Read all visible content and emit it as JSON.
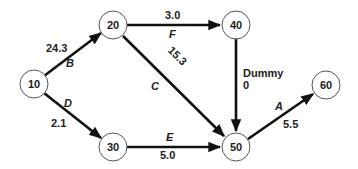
{
  "diagram": {
    "type": "activity-on-arrow network",
    "nodes": [
      {
        "id": "10",
        "label": "10",
        "x": 34,
        "y": 84
      },
      {
        "id": "20",
        "label": "20",
        "x": 113,
        "y": 25
      },
      {
        "id": "30",
        "label": "30",
        "x": 113,
        "y": 147
      },
      {
        "id": "40",
        "label": "40",
        "x": 236,
        "y": 25
      },
      {
        "id": "50",
        "label": "50",
        "x": 236,
        "y": 147
      },
      {
        "id": "60",
        "label": "60",
        "x": 326,
        "y": 85
      }
    ],
    "edges": [
      {
        "from": "10",
        "to": "20",
        "activity": "B",
        "duration": "24.3"
      },
      {
        "from": "10",
        "to": "30",
        "activity": "D",
        "duration": "2.1"
      },
      {
        "from": "20",
        "to": "40",
        "activity": "F",
        "duration": "3.0"
      },
      {
        "from": "20",
        "to": "50",
        "activity": "C",
        "duration": "15.3"
      },
      {
        "from": "30",
        "to": "50",
        "activity": "E",
        "duration": "5.0"
      },
      {
        "from": "40",
        "to": "50",
        "activity": "Dummy",
        "duration": "0"
      },
      {
        "from": "50",
        "to": "60",
        "activity": "A",
        "duration": "5.5"
      }
    ]
  }
}
